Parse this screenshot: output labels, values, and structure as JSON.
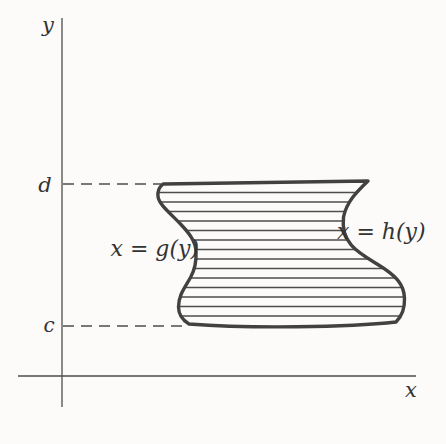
{
  "figure": {
    "colors": {
      "background": "#fcfbf9",
      "axis": "#4d4d4d",
      "curve": "#414141",
      "hatch": "#4d4d4d",
      "text": "#333333"
    },
    "labels": {
      "y_axis": "y",
      "x_axis": "x",
      "upper_bound": "d",
      "lower_bound": "c",
      "left_curve": "x = g(y)",
      "right_curve": "x = h(y)"
    },
    "geometry": {
      "region_path": "M 163 184 L 368 181 C 357 191.5 346.5 202 343.5 217 C 340.5 243 358 252.5 377 264 C 396 275.5 404 284 404.5 298 C 405 310 400.5 317.5 396 322 C 348 327.5 248 328.5 189 324 C 182.5 320 178.5 314 178.5 307 C 178.5 295 185 287.5 190.5 277.5 C 195.5 268.5 196.5 261 196 251.5 C 195.5 240.5 188.5 232.5 180.5 224 C 170 213 159 204.5 158 196.5 C 157.3 191 160 186.5 163 184 Z",
      "hatch_y_start": 192.5,
      "hatch_spacing": 9.5,
      "hatch_count": 14,
      "hatch_x1": 150,
      "hatch_x2": 414,
      "y_axis": {
        "x": 62,
        "y1": 18,
        "y2": 407
      },
      "x_axis": {
        "y": 376,
        "x1": 18,
        "x2": 416
      },
      "d_guide": {
        "y": 184,
        "x1": 63,
        "x2": 161
      },
      "c_guide": {
        "y": 326,
        "x1": 63,
        "x2": 187
      }
    }
  }
}
